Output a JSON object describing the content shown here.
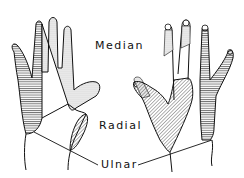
{
  "views": [
    "palmar",
    "dorsal"
  ],
  "labels": {
    "median": "Median",
    "radial": "Radial",
    "ulnar": "Ulnar"
  },
  "legend": [
    {
      "nerve": "Median",
      "pattern": "stippled"
    },
    {
      "nerve": "Radial",
      "pattern": "diagonal hatching"
    },
    {
      "nerve": "Ulnar",
      "pattern": "horizontal hatching"
    }
  ]
}
